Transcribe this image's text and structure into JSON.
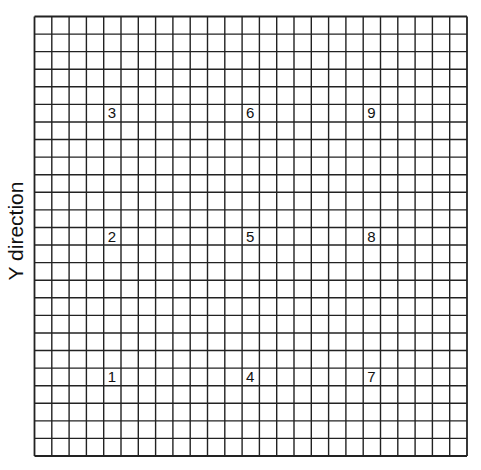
{
  "diagram": {
    "title": "",
    "axis_label": "Y direction",
    "grid": {
      "columns": 25,
      "rows": 25,
      "line_color": "#222222"
    },
    "points": [
      {
        "label": "1",
        "col": 4,
        "row": 20
      },
      {
        "label": "2",
        "col": 4,
        "row": 12
      },
      {
        "label": "3",
        "col": 4,
        "row": 5
      },
      {
        "label": "4",
        "col": 12,
        "row": 20
      },
      {
        "label": "5",
        "col": 12,
        "row": 12
      },
      {
        "label": "6",
        "col": 12,
        "row": 5
      },
      {
        "label": "7",
        "col": 19,
        "row": 20
      },
      {
        "label": "8",
        "col": 19,
        "row": 12
      },
      {
        "label": "9",
        "col": 19,
        "row": 5
      }
    ]
  }
}
